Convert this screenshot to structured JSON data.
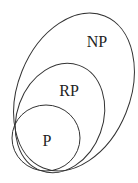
{
  "diagram": {
    "type": "nested-sets",
    "sets": [
      {
        "label": "NP",
        "contains": [
          "RP",
          "P"
        ]
      },
      {
        "label": "RP",
        "contains": [
          "P"
        ]
      },
      {
        "label": "P",
        "contains": []
      }
    ]
  },
  "labels": {
    "np": "NP",
    "rp": "RP",
    "p": "P"
  },
  "colors": {
    "stroke": "#333333",
    "text": "#222222",
    "background": "#ffffff"
  }
}
